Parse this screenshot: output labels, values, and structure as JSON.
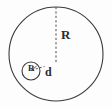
{
  "figure": {
    "type": "geometry-diagram",
    "background_color": "#fdfdfd",
    "stroke_color": "#3a3a3a",
    "label_color": "#2b2b2b"
  },
  "labels": {
    "outer_radius": "R",
    "inner_radius": "R",
    "distance": "d"
  },
  "shapes": {
    "outer_circle": {
      "name": "outer-circle",
      "cx": 56,
      "cy": 54,
      "r": 47
    },
    "inner_circle": {
      "name": "inner-circle",
      "cx": 31,
      "cy": 71,
      "r": 9
    },
    "outer_radius_line": {
      "name": "outer-radius-dashed-line",
      "x1": 56,
      "y1": 7,
      "x2": 56,
      "y2": 63,
      "style": "dashed"
    },
    "distance_line": {
      "name": "distance-dashed-line",
      "x1": 32,
      "y1": 71,
      "x2": 44,
      "y2": 67,
      "style": "dashed"
    },
    "inner_radius_tick": {
      "name": "inner-radius-tick",
      "x1": 31,
      "y1": 71,
      "x2": 37,
      "y2": 66,
      "style": "solid"
    }
  }
}
